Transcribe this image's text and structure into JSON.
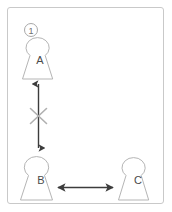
{
  "panel": {
    "index_label": "1",
    "border_color": "#c9c9c9",
    "background": "#ffffff"
  },
  "diagram": {
    "type": "relationship-diagram",
    "node_outline_color": "#b5b5b5",
    "arrow_color": "#3c3c3c",
    "cross_color": "#b0b0b0",
    "label_color": "#4a4a4a",
    "nodes": [
      {
        "id": "A",
        "label": "A",
        "shape": "person-silhouette",
        "x": 40,
        "y": 55
      },
      {
        "id": "B",
        "label": "B",
        "shape": "person-silhouette",
        "x": 41,
        "y": 176
      },
      {
        "id": "C",
        "label": "C",
        "shape": "person-silhouette",
        "x": 138,
        "y": 176
      }
    ],
    "edges": [
      {
        "from": "A",
        "to": "B",
        "orientation": "vertical",
        "arrowheads": "both",
        "crossed_out": true,
        "meaning": "blocked-connection"
      },
      {
        "from": "B",
        "to": "C",
        "orientation": "horizontal",
        "arrowheads": "both",
        "crossed_out": false,
        "meaning": "active-connection"
      }
    ]
  }
}
